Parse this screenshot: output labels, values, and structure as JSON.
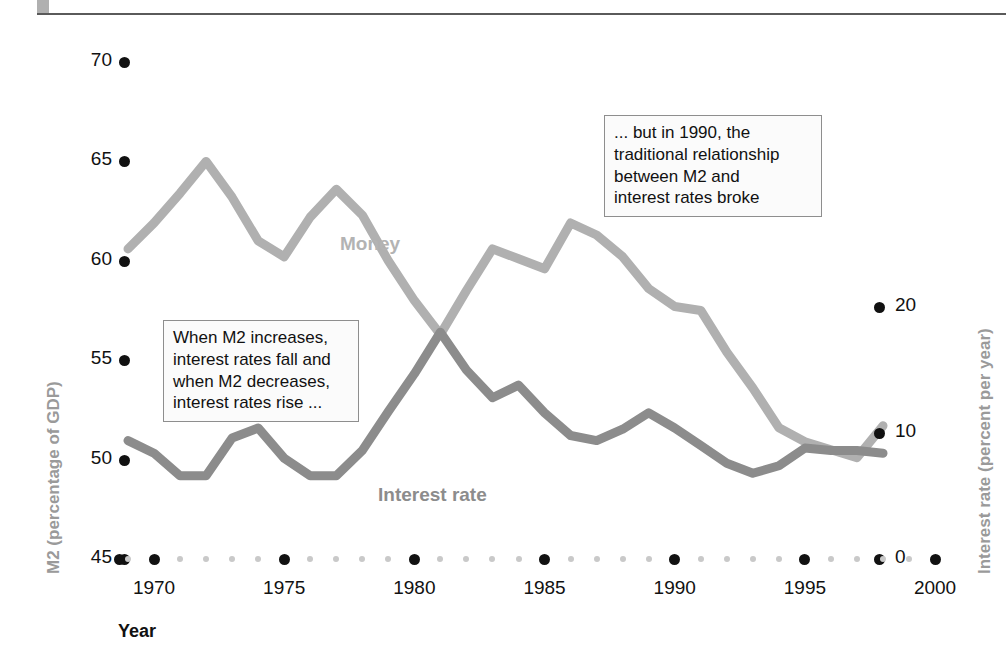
{
  "header": {
    "title": ""
  },
  "chart_data": {
    "type": "line",
    "title": "",
    "xlabel": "Year",
    "ylabel": "M2 (percentage of GDP)",
    "ylabel_right": "Interest rate (percent per year)",
    "xlim": [
      1969,
      2000
    ],
    "ylim": [
      45,
      70
    ],
    "ylim_right": [
      0,
      25
    ],
    "xticks": [
      1970,
      1975,
      1980,
      1985,
      1990,
      1995,
      2000
    ],
    "xtick_labels": [
      "1970",
      "1975",
      "1980",
      "1985",
      "1990",
      "1995",
      "2000"
    ],
    "yticks_left": [
      45,
      50,
      55,
      60,
      65,
      70
    ],
    "ytick_labels_left": [
      "45",
      "50",
      "55",
      "60",
      "65",
      "70"
    ],
    "yticks_right": [
      0,
      10,
      20
    ],
    "ytick_labels_right": [
      "0",
      "10",
      "20"
    ],
    "grid": false,
    "legend_position": "inline",
    "series": [
      {
        "name": "Money",
        "axis": "left",
        "color": "#b0b0b0",
        "x": [
          1969,
          1970,
          1971,
          1972,
          1973,
          1974,
          1975,
          1976,
          1977,
          1978,
          1979,
          1980,
          1981,
          1982,
          1983,
          1984,
          1985,
          1986,
          1987,
          1988,
          1989,
          1990,
          1991,
          1992,
          1993,
          1994,
          1995,
          1996,
          1997,
          1998
        ],
        "values": [
          60.6,
          61.9,
          63.4,
          65.0,
          63.2,
          61.0,
          60.2,
          62.2,
          63.6,
          62.3,
          60.0,
          58.0,
          56.3,
          58.5,
          60.6,
          60.1,
          59.6,
          61.9,
          61.3,
          60.2,
          58.6,
          57.7,
          57.5,
          55.4,
          53.6,
          51.6,
          50.9,
          50.5,
          50.1,
          51.7
        ]
      },
      {
        "name": "Interest rate",
        "axis": "right",
        "color": "#8c8c8c",
        "x": [
          1969,
          1970,
          1971,
          1972,
          1973,
          1974,
          1975,
          1976,
          1977,
          1978,
          1979,
          1980,
          1981,
          1982,
          1983,
          1984,
          1985,
          1986,
          1987,
          1988,
          1989,
          1990,
          1991,
          1992,
          1993,
          1994,
          1995,
          1996,
          1997,
          1998
        ],
        "values": [
          9.4,
          8.4,
          6.6,
          6.6,
          9.6,
          10.4,
          8.0,
          6.6,
          6.6,
          8.6,
          11.7,
          14.7,
          18.0,
          15.0,
          12.8,
          13.8,
          11.6,
          9.8,
          9.4,
          10.3,
          11.6,
          10.4,
          9.0,
          7.6,
          6.8,
          7.4,
          8.8,
          8.6,
          8.6,
          8.4
        ]
      }
    ],
    "annotations": [
      {
        "id": "callout-m2",
        "lines": [
          "When M2 increases,",
          "interest rates fall and",
          "when M2 decreases,",
          "interest rates rise ..."
        ]
      },
      {
        "id": "callout-1990",
        "lines": [
          "... but in 1990, the",
          "traditional relationship",
          "between M2 and",
          "interest rates broke"
        ]
      }
    ]
  }
}
